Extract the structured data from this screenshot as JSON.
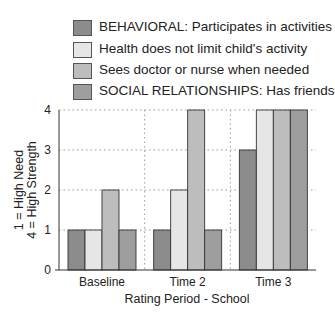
{
  "chart_data": {
    "type": "bar",
    "title": "",
    "xlabel": "Rating Period - School",
    "ylabel_line1": "1 = High Need",
    "ylabel_line2": "4 = High Strength",
    "ylim": [
      0,
      4
    ],
    "yticks": [
      "0",
      "1",
      "2",
      "3",
      "4"
    ],
    "grid": true,
    "legend_position": "top",
    "categories": [
      "Baseline",
      "Time 2",
      "Time 3"
    ],
    "series": [
      {
        "name": "BEHAVIORAL: Participates in activities",
        "color": "#8c8c8c",
        "values": [
          1,
          1,
          3
        ]
      },
      {
        "name": "Health does not limit child's activity",
        "color": "#e6e6e6",
        "values": [
          1,
          2,
          4
        ]
      },
      {
        "name": "Sees doctor or nurse when needed",
        "color": "#bdbdbd",
        "values": [
          2,
          4,
          4
        ]
      },
      {
        "name": "SOCIAL RELATIONSHIPS: Has friends",
        "color": "#9e9e9e",
        "values": [
          1,
          1,
          4
        ]
      }
    ]
  }
}
